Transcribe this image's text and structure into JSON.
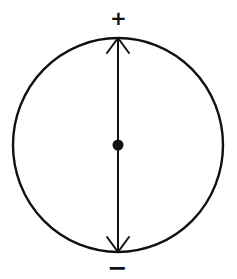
{
  "diagram": {
    "type": "dipole-in-circle",
    "colors": {
      "stroke": "#111111",
      "background": "#ffffff"
    },
    "circle": {
      "cx": 118,
      "cy": 145,
      "rx": 105,
      "ry": 107
    },
    "axis": {
      "x": 118,
      "y_top": 38,
      "y_bottom": 252
    },
    "center_dot": {
      "cx": 118,
      "cy": 145,
      "r": 5
    },
    "arrows": {
      "top": "arrowhead-up",
      "bottom": "arrowhead-down"
    },
    "labels": {
      "top": "+",
      "bottom": "−"
    }
  }
}
